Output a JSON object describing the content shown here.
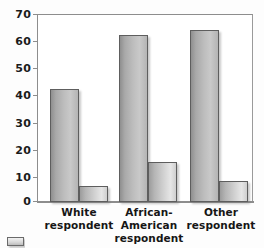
{
  "chart_data": {
    "type": "bar",
    "title": "",
    "xlabel": "",
    "ylabel": "",
    "ylim": [
      0,
      70
    ],
    "yticks": [
      0,
      10,
      20,
      30,
      40,
      50,
      60,
      70
    ],
    "ytick_labels": [
      "0",
      "10",
      "20",
      "30",
      "40",
      "50",
      "60",
      "70"
    ],
    "grid": true,
    "legend_position": "bottom-left",
    "categories": [
      "White respondent",
      "African-American respondent",
      "Other respondent"
    ],
    "category_lines": [
      {
        "line1": "White",
        "line2": "respondent"
      },
      {
        "line1": "African-American",
        "line2": "respondent"
      },
      {
        "line1": "Other",
        "line2": "respondent"
      }
    ],
    "series": [
      {
        "name": "Series 1",
        "values": [
          42,
          62,
          64
        ]
      },
      {
        "name": "Series 2",
        "values": [
          6,
          15,
          8
        ]
      }
    ]
  },
  "colors": {
    "axis": "#8d8d8d",
    "gridline": "#8f8f8f",
    "bar_series_1": "#bdbdbd",
    "bar_series_2": "#d2d2d2",
    "bar_edge": "#5e5e5e",
    "text": "#161616",
    "background": "#ffffff"
  }
}
